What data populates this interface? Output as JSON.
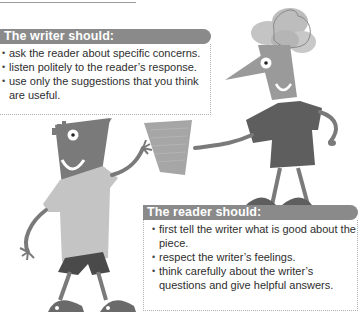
{
  "writer_panel": {
    "title": "The writer should:",
    "items": [
      "ask the reader about specific concerns.",
      "listen politely to the reader’s response.",
      "use only the suggestions that you think are useful."
    ]
  },
  "reader_panel": {
    "title": "The reader should:",
    "items": [
      "first tell the writer what is good about the piece.",
      "respect the writer’s feelings.",
      "think carefully about the writer’s questions and give helpful answers."
    ]
  },
  "bullet_glyph": "•",
  "colors": {
    "header_bg": "#8a8a8a",
    "header_text": "#ffffff",
    "body_text": "#2e2e2e",
    "border": "#b0b0b0"
  },
  "illustration": {
    "description": "Two cartoon figures exchanging a sheet of paper",
    "figures": [
      "writer-figure",
      "reader-figure"
    ]
  }
}
